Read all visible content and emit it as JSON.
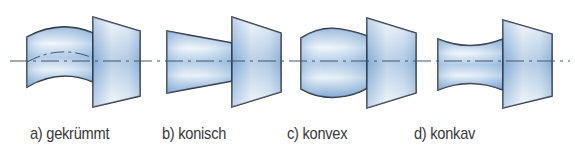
{
  "figure": {
    "colors": {
      "outline": "#2b3440",
      "fill_light": "#f2f7fc",
      "fill_mid": "#bcd3ea",
      "fill_dark": "#6f9ccc",
      "axis": "#44566a",
      "label_text": "#3a3a3a"
    },
    "axis_y": 61,
    "panels": [
      {
        "id": "a",
        "label": "a) gekrümmt",
        "label_x": 30,
        "shape": "curved"
      },
      {
        "id": "b",
        "label": "b) konisch",
        "label_x": 162,
        "shape": "conical"
      },
      {
        "id": "c",
        "label": "c) konvex",
        "label_x": 287,
        "shape": "convex"
      },
      {
        "id": "d",
        "label": "d) konkav",
        "label_x": 414,
        "shape": "concave"
      }
    ]
  }
}
